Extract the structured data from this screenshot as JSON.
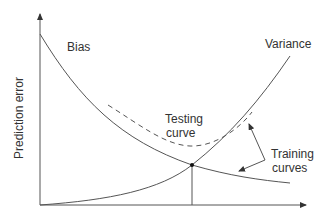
{
  "diagram": {
    "ylabel": "Prediction error",
    "labels": {
      "bias": "Bias",
      "variance": "Variance",
      "testing_1": "Testing",
      "testing_2": "curve",
      "training_1": "Training",
      "training_2": "curves"
    },
    "colors": {
      "line": "#555555",
      "text": "#333333"
    }
  }
}
